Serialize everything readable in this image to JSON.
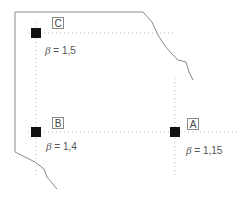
{
  "points": [
    {
      "id": "C",
      "label": "C",
      "beta_symbol": "β",
      "beta_text": "= 1,5",
      "x": 36,
      "y": 33
    },
    {
      "id": "B",
      "label": "B",
      "beta_symbol": "β",
      "beta_text": "= 1,4",
      "x": 36,
      "y": 132
    },
    {
      "id": "A",
      "label": "A",
      "beta_symbol": "β",
      "beta_text": "= 1,15",
      "x": 175,
      "y": 132
    }
  ],
  "colors": {
    "boundary": "#888888",
    "gridline": "#bbbbbb",
    "marker": "#111111"
  }
}
